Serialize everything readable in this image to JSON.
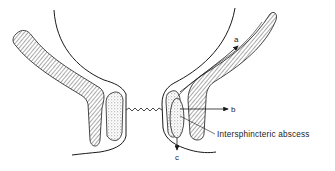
{
  "diagram": {
    "type": "anatomical cross-section",
    "labels": {
      "a": "a",
      "b": "b",
      "c": "c",
      "abscess": "Intersphincteric abscess"
    },
    "colors": {
      "line": "#1a1a1a",
      "hatch": "#555555",
      "stipple": "#777777",
      "background": "#ffffff"
    }
  }
}
